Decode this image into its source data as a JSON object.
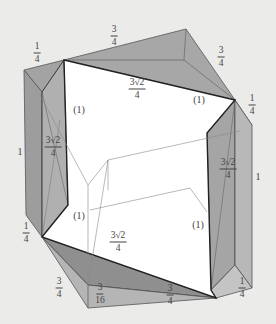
{
  "figure": {
    "colors": {
      "background": "#ebebea",
      "shade_dark": "#8f8f8f",
      "shade_mid": "#a9a9a9",
      "shade_light": "#bdbdbd",
      "hexagon_fill": "#ffffff",
      "edge_dark": "#2e2e2e",
      "edge_light": "#7a7a7a"
    },
    "labels": {
      "top_left_quarter": {
        "num": "1",
        "den": "4"
      },
      "top_three_quarter": {
        "num": "3",
        "den": "4"
      },
      "top_right_three_quarter": {
        "num": "3",
        "den": "4"
      },
      "right_quarter": {
        "num": "1",
        "den": "4"
      },
      "hex_top_edge": {
        "num": "3√2",
        "den": "4"
      },
      "hex_left_edge": {
        "num": "3√2",
        "den": "4"
      },
      "hex_right_edge": {
        "num": "3√2",
        "den": "4"
      },
      "hex_bottom_edge": {
        "num": "3√2",
        "den": "4"
      },
      "left_side_one": "1",
      "right_side_one": "1",
      "left_lower_quarter": {
        "num": "1",
        "den": "4"
      },
      "bottom_left_three_quarter": {
        "num": "3",
        "den": "4"
      },
      "bottom_three_sixteenth": {
        "num": "3",
        "den": "16"
      },
      "bottom_three_quarter": {
        "num": "3",
        "den": "4"
      },
      "bottom_right_quarter": {
        "num": "1",
        "den": "4"
      },
      "unit_upper_left": "(1)",
      "unit_upper_right": "(1)",
      "unit_lower_left": "(1)",
      "unit_lower_right": "(1)"
    }
  }
}
